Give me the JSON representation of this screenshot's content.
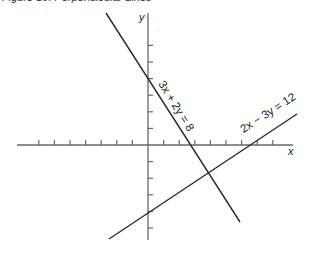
{
  "figure": {
    "title": "Figure 10: Perpendicular Lines"
  },
  "axes": {
    "x_label": "x",
    "y_label": "y",
    "origin_px": [
      148,
      145
    ],
    "unit_x_px": 15.6,
    "unit_y_px": 16.6,
    "x_axis_px": [
      17,
      293
    ],
    "y_axis_px": [
      13,
      240
    ],
    "x_ticks": [
      -7,
      -6,
      -5,
      -4,
      -3,
      -2,
      -1,
      1,
      2,
      3,
      4,
      5,
      6,
      7,
      8
    ],
    "y_ticks": [
      6,
      5,
      4,
      3,
      2,
      1,
      -1,
      -2,
      -3,
      -4,
      -5
    ]
  },
  "lines": [
    {
      "equation": "3x + 2y = 8",
      "label": "3x + 2y = 8",
      "y_intercept": 4,
      "x_intercept": 2.67,
      "from_px": [
        106,
        13
      ],
      "to_px": [
        240,
        222
      ],
      "label_center_px": [
        173,
        108
      ],
      "label_angle": 58
    },
    {
      "equation": "2x − 3y = 12",
      "label": "2x − 3y = 12",
      "y_intercept": -4,
      "x_intercept": 6,
      "from_px": [
        109,
        239
      ],
      "to_px": [
        297,
        114
      ],
      "label_center_px": [
        270,
        116
      ],
      "label_angle": -33
    }
  ],
  "intersection": {
    "x": 3.69,
    "y": -0.92
  }
}
